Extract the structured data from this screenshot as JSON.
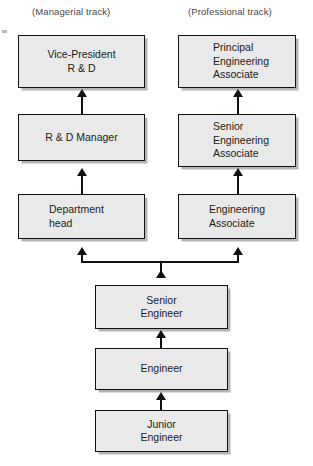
{
  "diagram": {
    "headers": [
      {
        "id": "managerial",
        "label": "(Managerial track)"
      },
      {
        "id": "professional",
        "label": "(Professional track)"
      }
    ],
    "colors": {
      "box_fill": "#e9e9e9",
      "box_border": "#111111",
      "shadow": "#787878",
      "text": "#1b1b1b",
      "header_text": "#4a4a4a",
      "background": "#ffffff"
    },
    "nodes": [
      {
        "id": "vice-president-rd",
        "track": "managerial",
        "level": 1,
        "align": "center",
        "lines": [
          "Vice-President",
          "R & D"
        ]
      },
      {
        "id": "principal-engineering-associate",
        "track": "professional",
        "level": 1,
        "align": "left",
        "lines": [
          "Principal",
          "Engineering",
          "Associate"
        ]
      },
      {
        "id": "rd-manager",
        "track": "managerial",
        "level": 2,
        "align": "center",
        "lines": [
          "R & D Manager"
        ]
      },
      {
        "id": "senior-engineering-associate",
        "track": "professional",
        "level": 2,
        "align": "left",
        "lines": [
          "Senior",
          "Engineering",
          "Associate"
        ]
      },
      {
        "id": "department-head",
        "track": "managerial",
        "level": 3,
        "align": "left",
        "lines": [
          "Department",
          "head"
        ]
      },
      {
        "id": "engineering-associate",
        "track": "professional",
        "level": 3,
        "align": "left",
        "lines": [
          "Engineering",
          "Associate"
        ]
      },
      {
        "id": "senior-engineer",
        "track": "common",
        "level": 4,
        "align": "center",
        "lines": [
          "Senior",
          "Engineer"
        ]
      },
      {
        "id": "engineer",
        "track": "common",
        "level": 5,
        "align": "center",
        "lines": [
          "Engineer"
        ]
      },
      {
        "id": "junior-engineer",
        "track": "common",
        "level": 6,
        "align": "center",
        "lines": [
          "Junior",
          "Engineer"
        ]
      }
    ],
    "edges": [
      {
        "from": "rd-manager",
        "to": "vice-president-rd"
      },
      {
        "from": "department-head",
        "to": "rd-manager"
      },
      {
        "from": "senior-engineering-associate",
        "to": "principal-engineering-associate"
      },
      {
        "from": "engineering-associate",
        "to": "senior-engineering-associate"
      },
      {
        "from": "senior-engineer",
        "to": "department-head"
      },
      {
        "from": "senior-engineer",
        "to": "engineering-associate"
      },
      {
        "from": "engineer",
        "to": "senior-engineer"
      },
      {
        "from": "junior-engineer",
        "to": "engineer"
      }
    ]
  }
}
